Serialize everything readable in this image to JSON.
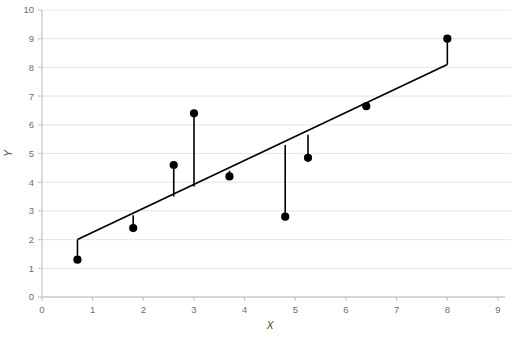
{
  "chart_data": {
    "type": "scatter",
    "title": "",
    "subtitle": "",
    "xlabel": "X",
    "ylabel": "Y",
    "xlim": [
      0,
      9
    ],
    "ylim": [
      0,
      10
    ],
    "xticks": [
      0,
      1,
      2,
      3,
      4,
      5,
      6,
      7,
      8,
      9
    ],
    "yticks": [
      0,
      1,
      2,
      3,
      4,
      5,
      6,
      7,
      8,
      9,
      10
    ],
    "grid": "horizontal",
    "legend": "none",
    "series": [
      {
        "name": "observations",
        "type": "scatter",
        "marker": "filled-circle",
        "color": "#000000",
        "points": [
          {
            "x": 0.7,
            "y": 1.3,
            "fit": 2.0,
            "residual": -0.7
          },
          {
            "x": 1.8,
            "y": 2.4,
            "fit": 2.85,
            "residual": -0.45
          },
          {
            "x": 2.6,
            "y": 4.6,
            "fit": 3.5,
            "residual": 1.1
          },
          {
            "x": 3.0,
            "y": 6.4,
            "fit": 3.85,
            "residual": 2.55
          },
          {
            "x": 3.7,
            "y": 4.2,
            "fit": 4.4,
            "residual": -0.2
          },
          {
            "x": 4.8,
            "y": 2.8,
            "fit": 5.3,
            "residual": -2.5
          },
          {
            "x": 5.25,
            "y": 4.85,
            "fit": 5.65,
            "residual": -0.8
          },
          {
            "x": 6.4,
            "y": 6.65,
            "fit": 6.6,
            "residual": 0.05
          },
          {
            "x": 8.0,
            "y": 9.0,
            "fit": 8.1,
            "residual": 0.9
          }
        ]
      },
      {
        "name": "regression-line",
        "type": "line",
        "color": "#000000",
        "x_start": 0.7,
        "y_start": 2.0,
        "x_end": 8.0,
        "y_end": 8.1,
        "slope": 0.835,
        "intercept": 1.415
      },
      {
        "name": "residual-segments",
        "type": "stems",
        "color": "#000000",
        "description": "vertical segments from each observed point to the regression line"
      }
    ],
    "colors": {
      "background": "#ffffff",
      "gridline": "#e9e9e9",
      "axis": "#c9c9c9",
      "tick_label": "#6e6e6e",
      "marker": "#000000",
      "line": "#000000"
    }
  }
}
